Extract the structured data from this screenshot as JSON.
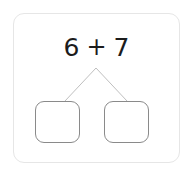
{
  "worksheet": {
    "type": "number-bond-decomposition",
    "card": {
      "background_color": "#ffffff",
      "border_color": "#e6e6e6"
    },
    "equation": {
      "first_addend": "6",
      "operator": "+",
      "second_addend": "7",
      "full_text": "6 + 7",
      "text_color": "#1c1c1c"
    },
    "connectors": {
      "line_color": "#bfbfbf",
      "apex_label": "apex-point"
    },
    "answer_boxes": [
      {
        "position": "left",
        "value": "",
        "placeholder": "",
        "border_color": "#8a8a8a"
      },
      {
        "position": "right",
        "value": "",
        "placeholder": "",
        "border_color": "#8a8a8a"
      }
    ]
  }
}
